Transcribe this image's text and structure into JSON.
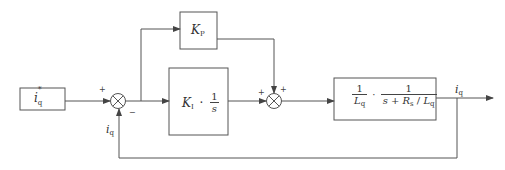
{
  "diagram": {
    "type": "block-diagram",
    "title": "",
    "colors": {
      "line": "#555555",
      "text": "#333333",
      "background": "#ffffff"
    },
    "input": {
      "symbol": "i",
      "subscript": "q",
      "superscript": "*"
    },
    "sum1": {
      "plus_sign": "+",
      "minus_sign": "−"
    },
    "blocks": {
      "kp": {
        "symbol": "K",
        "subscript": "P"
      },
      "ki": {
        "symbol": "K",
        "subscript": "I",
        "dot": "·",
        "num": "1",
        "den": "s"
      },
      "plant": {
        "f1_num": "1",
        "f1_den_sym": "L",
        "f1_den_sub": "q",
        "dot": "·",
        "f2_num": "1",
        "f2_den_pre": "s + ",
        "f2_den_R": "R",
        "f2_den_Rsub": "s",
        "f2_den_mid": " / ",
        "f2_den_L": "L",
        "f2_den_Lsub": "q"
      }
    },
    "sum2": {
      "plus_left": "+",
      "plus_top": "+"
    },
    "output": {
      "symbol": "i",
      "subscript": "q"
    },
    "feedback": {
      "symbol": "i",
      "subscript": "q"
    }
  }
}
